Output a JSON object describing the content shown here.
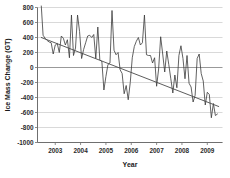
{
  "chart_data": {
    "type": "line",
    "title": "",
    "xlabel": "Year",
    "ylabel": "Ice Mass Change (GT)",
    "xlim": [
      2002.3,
      2009.6
    ],
    "ylim": [
      -1000,
      800
    ],
    "ytick_step": 200,
    "grid": true,
    "legend": "none",
    "xticks": [
      2003,
      2004,
      2005,
      2006,
      2007,
      2008,
      2009
    ],
    "xtick_labels": [
      "2003",
      "2004",
      "2005",
      "2006",
      "2007",
      "2008",
      "2009"
    ],
    "yticks": [
      800,
      600,
      400,
      200,
      0,
      -200,
      -400,
      -600,
      -800,
      -1000
    ],
    "ytick_labels": [
      "800",
      "600",
      "400",
      "200",
      "0",
      "-200",
      "-400",
      "-600",
      "-800",
      "-1000"
    ],
    "series": [
      {
        "name": "Ice Mass Change",
        "color": "#3a3a3a",
        "x": [
          2002.45,
          2002.52,
          2002.6,
          2002.68,
          2002.76,
          2002.84,
          2002.92,
          2003.0,
          2003.08,
          2003.16,
          2003.24,
          2003.32,
          2003.4,
          2003.48,
          2003.56,
          2003.64,
          2003.72,
          2003.8,
          2003.88,
          2003.96,
          2004.04,
          2004.12,
          2004.2,
          2004.28,
          2004.36,
          2004.44,
          2004.52,
          2004.6,
          2004.68,
          2004.76,
          2004.84,
          2004.92,
          2005.0,
          2005.08,
          2005.16,
          2005.24,
          2005.32,
          2005.4,
          2005.48,
          2005.56,
          2005.64,
          2005.72,
          2005.8,
          2005.88,
          2005.96,
          2006.04,
          2006.12,
          2006.2,
          2006.28,
          2006.36,
          2006.44,
          2006.52,
          2006.6,
          2006.68,
          2006.76,
          2006.84,
          2006.92,
          2007.0,
          2007.08,
          2007.16,
          2007.24,
          2007.32,
          2007.4,
          2007.48,
          2007.56,
          2007.64,
          2007.72,
          2007.8,
          2007.88,
          2007.96,
          2008.04,
          2008.12,
          2008.2,
          2008.28,
          2008.36,
          2008.44,
          2008.52,
          2008.6,
          2008.68,
          2008.76,
          2008.84,
          2008.92,
          2009.0,
          2009.08,
          2009.16,
          2009.24,
          2009.32,
          2009.4
        ],
        "y": [
          820,
          430,
          390,
          360,
          340,
          330,
          180,
          300,
          320,
          200,
          420,
          390,
          300,
          370,
          130,
          700,
          160,
          260,
          700,
          480,
          120,
          240,
          330,
          420,
          430,
          400,
          440,
          120,
          540,
          100,
          80,
          -300,
          -120,
          40,
          60,
          760,
          230,
          170,
          200,
          -30,
          -80,
          -350,
          -240,
          -430,
          -200,
          130,
          280,
          350,
          400,
          300,
          330,
          700,
          170,
          160,
          160,
          60,
          130,
          -250,
          -20,
          410,
          180,
          -60,
          220,
          40,
          -150,
          -340,
          -100,
          -270,
          160,
          290,
          120,
          -150,
          160,
          -210,
          -260,
          -460,
          -370,
          120,
          180,
          -80,
          -180,
          -500,
          -330,
          -360,
          -670,
          -480,
          -640,
          -620
        ]
      },
      {
        "name": "Linear trend",
        "color": "#4a4a4a",
        "type": "trendline",
        "x": [
          2002.45,
          2009.45
        ],
        "y": [
          400,
          -520
        ]
      }
    ]
  }
}
